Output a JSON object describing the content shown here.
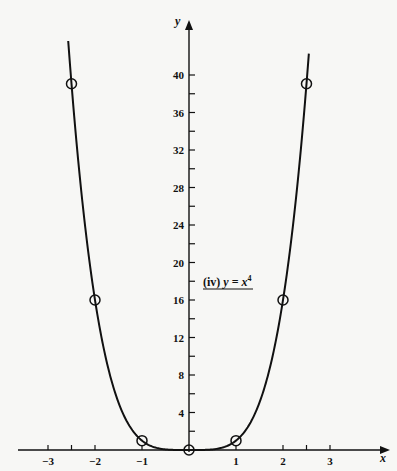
{
  "chart_data": {
    "type": "line",
    "title": "",
    "annotation": "(iv) y = x⁴",
    "annotation_parts": {
      "prefix": "(iv) ",
      "y": "y",
      "eq": " = ",
      "x": "x",
      "exp": "4"
    },
    "xlabel": "x",
    "ylabel": "y",
    "xlim": [
      -3.4,
      3.6
    ],
    "ylim": [
      0,
      44
    ],
    "x_ticks": [
      -3,
      -2.5,
      -2,
      -1,
      1,
      2,
      2.5,
      3
    ],
    "x_tick_labels": [
      {
        "value": -3,
        "label": "−3"
      },
      {
        "value": -2,
        "label": "−2"
      },
      {
        "value": -1,
        "label": "−1"
      },
      {
        "value": 1,
        "label": "1"
      },
      {
        "value": 2,
        "label": "2"
      },
      {
        "value": 3,
        "label": "3"
      }
    ],
    "y_ticks": [
      2,
      4,
      6,
      8,
      10,
      12,
      14,
      16,
      18,
      20,
      22,
      24,
      26,
      28,
      30,
      32,
      34,
      36,
      38,
      40
    ],
    "y_tick_labels": [
      {
        "value": 4,
        "label": "4"
      },
      {
        "value": 8,
        "label": "8"
      },
      {
        "value": 12,
        "label": "12"
      },
      {
        "value": 16,
        "label": "16"
      },
      {
        "value": 20,
        "label": "20"
      },
      {
        "value": 24,
        "label": "24"
      },
      {
        "value": 28,
        "label": "28"
      },
      {
        "value": 32,
        "label": "32"
      },
      {
        "value": 36,
        "label": "36"
      },
      {
        "value": 40,
        "label": "40"
      }
    ],
    "grid": false,
    "series": [
      {
        "name": "y = x^4",
        "function": "x^4",
        "x_range": [
          -2.57,
          2.55
        ],
        "color": "#111111",
        "marked_points": [
          {
            "x": -2.5,
            "y": 39.0625
          },
          {
            "x": -2,
            "y": 16
          },
          {
            "x": -1,
            "y": 1
          },
          {
            "x": 0,
            "y": 0
          },
          {
            "x": 1,
            "y": 1
          },
          {
            "x": 2,
            "y": 16
          },
          {
            "x": 2.5,
            "y": 39.0625
          }
        ]
      }
    ]
  }
}
